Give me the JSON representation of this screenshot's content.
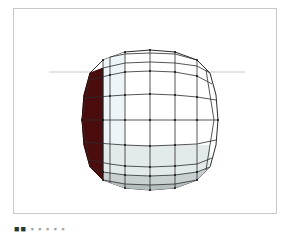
{
  "figure": {
    "type": "wireframe-sphere-render",
    "frame_border_color": "#c9c9c9",
    "background_color": "#ffffff",
    "horizon_line": {
      "color": "#c8c8c8",
      "y": 72,
      "x_start": 49,
      "x_end": 245
    },
    "sphere": {
      "center": [
        150,
        120
      ],
      "rx": 67,
      "ry": 70,
      "wire_color": "#2b2b2b",
      "vertex_color": "#111111",
      "highlight_face_color": "#4a0c0c",
      "shade_light": "#eef5f8",
      "shade_mid": "#d9e0e2",
      "shade_dark": "#bfc6c8",
      "meridians": 10,
      "parallels": 8
    }
  },
  "caption": {
    "prefix": "■■",
    "text": "▪ ▪ ▪ ▪ ▪"
  }
}
